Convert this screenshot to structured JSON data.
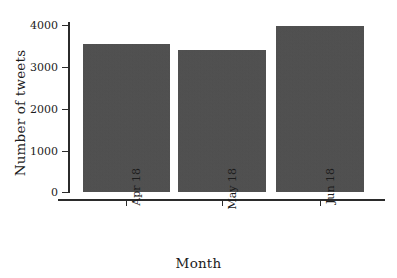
{
  "chart_data": {
    "type": "bar",
    "title": "",
    "subtitle": "",
    "xlabel": "Month",
    "ylabel": "Number of tweets",
    "categories": [
      "Apr 18",
      "May 18",
      "Jun 18"
    ],
    "values": [
      3540,
      3400,
      3970
    ],
    "series": [
      {
        "name": "Number of tweets",
        "values": [
          3540,
          3400,
          3970
        ]
      }
    ],
    "ylim": [
      0,
      4100
    ],
    "yticks": [
      0,
      1000,
      2000,
      3000,
      4000
    ],
    "ytick_labels": [
      "0",
      "1000",
      "2000",
      "3000",
      "4000"
    ],
    "xtick_labels": [
      "Apr 18",
      "May 18",
      "Jun 18"
    ],
    "xtick_rotation": 90,
    "grid": false,
    "legend": false,
    "legend_position": "none",
    "bar_color": "#4d4d4d",
    "axis_color": "#2b2b2b",
    "background_color": "#ffffff",
    "annotations": []
  }
}
